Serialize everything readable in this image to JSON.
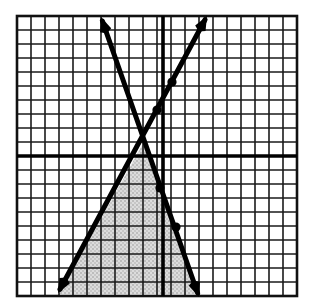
{
  "figure": {
    "type": "coordinate-grid-graph",
    "canvas": {
      "width": 315,
      "height": 308,
      "background": "#ffffff"
    }
  },
  "grid": {
    "name": "coordinate-grid",
    "left": 17,
    "top": 16,
    "right": 297,
    "bottom": 296,
    "columns": 20,
    "rows": 20,
    "cell_size": 14,
    "minor_line_color": "#1a1a1a",
    "minor_line_width": 1.6,
    "border_color": "#111111",
    "border_width": 2.6
  },
  "axes": {
    "x_axis": {
      "name": "x-axis",
      "y": 156,
      "x_start": 17,
      "x_end": 297,
      "color": "#000000",
      "width": 3.6
    },
    "y_axis": {
      "name": "y-axis",
      "x": 163,
      "y_start": 16,
      "y_end": 296,
      "color": "#000000",
      "width": 3.6
    }
  },
  "chart_data": {
    "type": "line",
    "title": "",
    "xlabel": "",
    "ylabel": "",
    "grid": true,
    "legend": "none",
    "origin_px": {
      "x": 163,
      "y": 156
    },
    "unit_px": 14,
    "xlim": [
      -10.4,
      9.6
    ],
    "ylim": [
      -10,
      10
    ],
    "series": [
      {
        "name": "rising-line",
        "label": "line-1",
        "color": "#000000",
        "width": 5,
        "arrows": "both",
        "endpoints_px": [
          {
            "x": 58,
            "y": 293
          },
          {
            "x": 207,
            "y": 16
          }
        ],
        "endpoints_units": [
          {
            "x": -7.5,
            "y": -9.8
          },
          {
            "x": 3.1,
            "y": 10.0
          }
        ],
        "slope_units": 1.86,
        "markers_px": [
          {
            "x": 172,
            "y": 82
          },
          {
            "x": 157,
            "y": 110
          }
        ]
      },
      {
        "name": "falling-line",
        "label": "line-2",
        "color": "#000000",
        "width": 5,
        "arrows": "both",
        "endpoints_px": [
          {
            "x": 101,
            "y": 17
          },
          {
            "x": 199,
            "y": 297
          }
        ],
        "endpoints_units": [
          {
            "x": -4.4,
            "y": 9.9
          },
          {
            "x": 2.6,
            "y": -10.1
          }
        ],
        "slope_units": -2.86,
        "markers_px": [
          {
            "x": 160,
            "y": 188
          },
          {
            "x": 176,
            "y": 227
          }
        ]
      }
    ],
    "intersection_px": {
      "x": 145,
      "y": 140
    },
    "intersection_units": {
      "x": -1.3,
      "y": 1.1
    },
    "shaded_region": {
      "name": "shaded-triangle",
      "fill": "#d5d5d5",
      "pattern": "stipple",
      "vertices_px": [
        {
          "x": 145,
          "y": 140
        },
        {
          "x": 59,
          "y": 294
        },
        {
          "x": 196,
          "y": 294
        }
      ],
      "vertices_units": [
        {
          "x": -1.3,
          "y": 1.1
        },
        {
          "x": -7.4,
          "y": -9.9
        },
        {
          "x": 2.4,
          "y": -9.9
        }
      ]
    }
  }
}
